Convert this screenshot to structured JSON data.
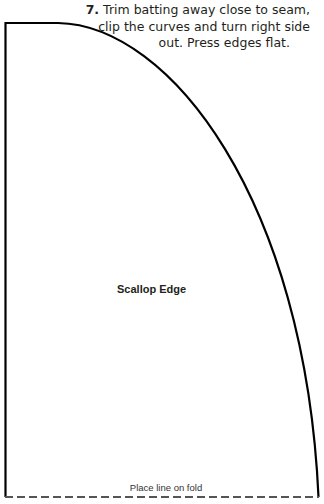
{
  "instruction": {
    "step_number": "7.",
    "line1": "Trim batting away close to seam,",
    "line2": "clip the curves and turn right side",
    "line3": "out. Press edges flat."
  },
  "pattern": {
    "piece_label": "Scallop Edge",
    "fold_label": "Place line on fold",
    "outline_color": "#000000",
    "fold_line_color": "#555555"
  }
}
